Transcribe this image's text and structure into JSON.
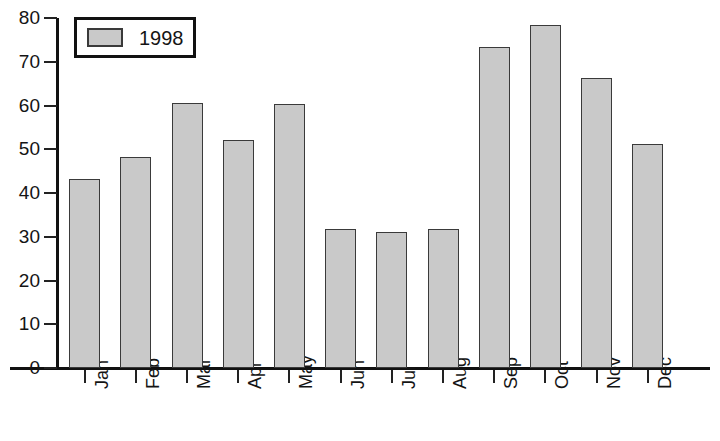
{
  "chart_data": {
    "type": "bar",
    "title": "",
    "subtitle": "",
    "xlabel": "",
    "ylabel": "",
    "categories": [
      "Jan",
      "Feb",
      "Mar",
      "Apr",
      "May",
      "Jun",
      "Jul",
      "Aug",
      "Sep",
      "Oct",
      "Nov",
      "Dec"
    ],
    "series": [
      {
        "name": "1998",
        "values": [
          43.2,
          48.2,
          60.5,
          52.1,
          60.4,
          31.7,
          31.0,
          31.7,
          73.4,
          78.4,
          66.4,
          51.1
        ]
      }
    ],
    "ylim": [
      0,
      80
    ],
    "yticks": [
      0,
      10,
      20,
      30,
      40,
      50,
      60,
      70,
      80
    ],
    "ytick_labels": [
      "0",
      "10",
      "20",
      "30",
      "40",
      "50",
      "60",
      "70",
      "80"
    ],
    "grid": false,
    "legend": {
      "position": "top-left",
      "entries": [
        {
          "label": "1998",
          "color": "#c9c9c9"
        }
      ]
    },
    "colors": {
      "bar_fill": "#c9c9c9",
      "bar_stroke": "#3a3a3a",
      "axis": "#111111",
      "text": "#141414",
      "background": "#ffffff"
    }
  }
}
